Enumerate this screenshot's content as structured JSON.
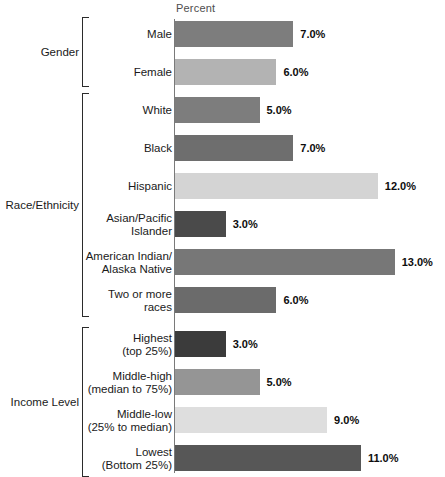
{
  "chart_data": {
    "type": "bar",
    "title": "",
    "subtitle": "",
    "xlabel": "Percent",
    "ylabel": "",
    "orientation": "horizontal",
    "grid": false,
    "legend": "none",
    "xlim": [
      0,
      13
    ],
    "value_suffix": "%",
    "groups": [
      {
        "name": "Gender",
        "categories": [
          "Male",
          "Female"
        ],
        "values": [
          7.0,
          6.0
        ],
        "value_labels": [
          "7.0%",
          "6.0%"
        ],
        "colors": [
          "#7d7d7d",
          "#b3b3b3"
        ]
      },
      {
        "name": "Race/Ethnicity",
        "categories": [
          "White",
          "Black",
          "Hispanic",
          "Asian/Pacific\nIslander",
          "American Indian/\nAlaska Native",
          "Two or more\nraces"
        ],
        "values": [
          5.0,
          7.0,
          12.0,
          3.0,
          13.0,
          6.0
        ],
        "value_labels": [
          "5.0%",
          "7.0%",
          "12.0%",
          "3.0%",
          "13.0%",
          "6.0%"
        ],
        "colors": [
          "#7d7d7d",
          "#6e6e6e",
          "#d4d4d4",
          "#4a4a4a",
          "#777777",
          "#6b6b6b"
        ]
      },
      {
        "name": "Income Level",
        "categories": [
          "Highest\n(top 25%)",
          "Middle-high\n(median to 75%)",
          "Middle-low\n(25% to median)",
          "Lowest\n(Bottom 25%)"
        ],
        "values": [
          3.0,
          5.0,
          9.0,
          11.0
        ],
        "value_labels": [
          "3.0%",
          "5.0%",
          "9.0%",
          "11.0%"
        ],
        "colors": [
          "#3b3b3b",
          "#959595",
          "#dedede",
          "#575757"
        ]
      }
    ]
  },
  "axis": {
    "header_label": "Percent"
  },
  "layout": {
    "axis_x": 174,
    "px_per_unit": 16.9,
    "bar_height": 26
  }
}
